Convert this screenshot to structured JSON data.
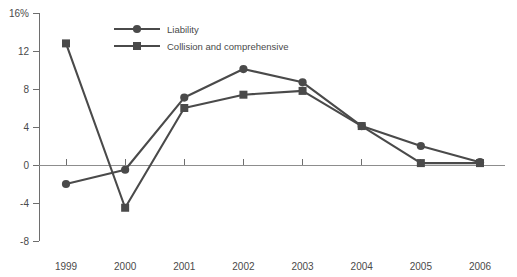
{
  "chart_data": {
    "type": "line",
    "title": "",
    "subtitle": "",
    "xlabel": "",
    "ylabel": "",
    "categories": [
      "1999",
      "2000",
      "2001",
      "2002",
      "2003",
      "2004",
      "2005",
      "2006"
    ],
    "series": [
      {
        "name": "Liability",
        "marker": "circle",
        "color": "#4a4a4a",
        "values": [
          -2.0,
          -0.5,
          7.1,
          10.1,
          8.7,
          4.1,
          2.0,
          0.3
        ]
      },
      {
        "name": "Collision and comprehensive",
        "marker": "square",
        "color": "#4a4a4a",
        "values": [
          12.8,
          -4.5,
          6.0,
          7.4,
          7.8,
          4.1,
          0.2,
          0.2
        ]
      }
    ],
    "ylim": [
      -8,
      16
    ],
    "yticks": [
      -8,
      -4,
      0,
      4,
      8,
      12,
      16
    ],
    "ytick_labels": [
      "-8",
      "-4",
      "0",
      "4",
      "8",
      "12",
      "16%"
    ],
    "xtick_labels": [
      "1999",
      "2000",
      "2001",
      "2002",
      "2003",
      "2004",
      "2005",
      "2006"
    ],
    "grid": false,
    "legend_position": "top-center",
    "zero_line": true
  },
  "legend": {
    "items": [
      {
        "label": "Liability",
        "marker": "circle"
      },
      {
        "label": "Collision and comprehensive",
        "marker": "square"
      }
    ]
  },
  "colors": {
    "series": "#4a4a4a",
    "axis": "#6e6e6e",
    "zero_line": "#8d8d8d",
    "text": "#4a4a4a",
    "background": "#ffffff"
  }
}
